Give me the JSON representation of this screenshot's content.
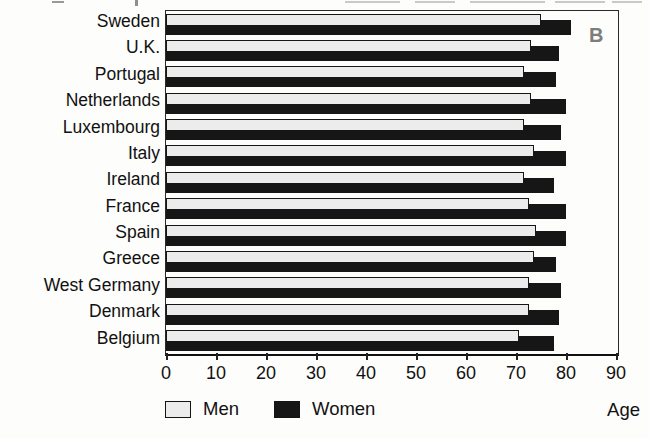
{
  "figure_label": "B",
  "colors": {
    "men_fill": "#ececec",
    "men_border": "#161616",
    "women_fill": "#161616",
    "frame": "#2a2a2a",
    "figure_label_gray": "#7d7d7d"
  },
  "legend": {
    "men_label": "Men",
    "women_label": "Women"
  },
  "axis_unit_label": "Age",
  "chart_data": {
    "type": "bar",
    "orientation": "horizontal",
    "title": "",
    "xlabel": "Age",
    "ylabel": "",
    "xlim": [
      0,
      90
    ],
    "xticks": [
      0,
      10,
      20,
      30,
      40,
      50,
      60,
      70,
      80,
      90
    ],
    "grid": false,
    "legend_position": "bottom-left",
    "categories": [
      "Sweden",
      "U.K.",
      "Portugal",
      "Netherlands",
      "Luxembourg",
      "Italy",
      "Ireland",
      "France",
      "Spain",
      "Greece",
      "West Germany",
      "Denmark",
      "Belgium"
    ],
    "series": [
      {
        "name": "Men",
        "color": "#ececec",
        "values": [
          75,
          73,
          71.5,
          73,
          71.5,
          73.5,
          71.5,
          72.5,
          74,
          73.5,
          72.5,
          72.5,
          70.5
        ]
      },
      {
        "name": "Women",
        "color": "#161616",
        "values": [
          81,
          78.5,
          78,
          80,
          79,
          80,
          77.5,
          80,
          80,
          78,
          79,
          78.5,
          77.5
        ]
      }
    ],
    "note": "Values are ages estimated from bar lengths"
  }
}
